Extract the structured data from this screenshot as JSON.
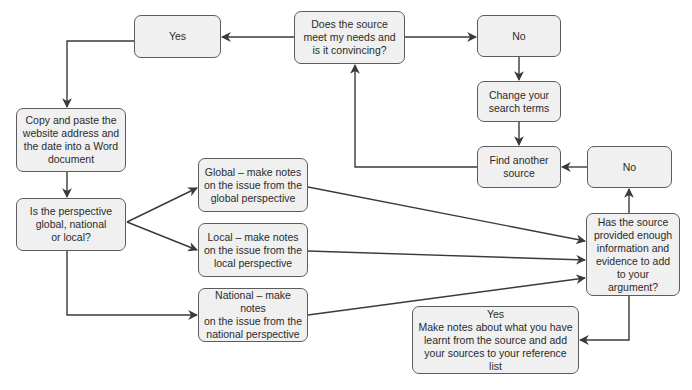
{
  "diagram": {
    "nodes": [
      {
        "id": "meet-needs",
        "text": "Does the source\nmeet my needs and\nis it convincing?"
      },
      {
        "id": "yes-top",
        "text": "Yes"
      },
      {
        "id": "no-top",
        "text": "No"
      },
      {
        "id": "change-terms",
        "text": "Change your\nsearch terms"
      },
      {
        "id": "find-another",
        "text": "Find another\nsource"
      },
      {
        "id": "no-right",
        "text": "No"
      },
      {
        "id": "copy-paste",
        "text": "Copy and paste the\nwebsite address and\nthe date into a Word\ndocument"
      },
      {
        "id": "perspective",
        "text": "Is the perspective\nglobal, national\nor local?"
      },
      {
        "id": "global",
        "text": "Global – make notes\non the issue from the\nglobal perspective"
      },
      {
        "id": "local",
        "text": "Local – make notes\non the issue from the\nlocal perspective"
      },
      {
        "id": "national",
        "text": "National – make notes\non the issue from the\nnational perspective"
      },
      {
        "id": "enough-info",
        "text": "Has the source\nprovided enough\ninformation and\nevidence to add\nto your argument?"
      },
      {
        "id": "yes-notes",
        "text": "Yes\nMake notes about what you have\nlearnt from the source and add\nyour sources to your reference list"
      }
    ],
    "edges": [
      {
        "from": "meet-needs",
        "to": "yes-top"
      },
      {
        "from": "meet-needs",
        "to": "no-top"
      },
      {
        "from": "no-top",
        "to": "change-terms"
      },
      {
        "from": "change-terms",
        "to": "find-another"
      },
      {
        "from": "find-another",
        "to": "meet-needs"
      },
      {
        "from": "yes-top",
        "to": "copy-paste"
      },
      {
        "from": "copy-paste",
        "to": "perspective"
      },
      {
        "from": "perspective",
        "to": "global"
      },
      {
        "from": "perspective",
        "to": "local"
      },
      {
        "from": "perspective",
        "to": "national"
      },
      {
        "from": "global",
        "to": "enough-info"
      },
      {
        "from": "local",
        "to": "enough-info"
      },
      {
        "from": "national",
        "to": "enough-info"
      },
      {
        "from": "enough-info",
        "to": "no-right"
      },
      {
        "from": "no-right",
        "to": "find-another"
      },
      {
        "from": "enough-info",
        "to": "yes-notes"
      }
    ],
    "colors": {
      "node_fill": "#f0f0f0",
      "node_border": "#5c5c5c",
      "text": "#2b2b2b",
      "connector": "#3a3a3a"
    }
  }
}
